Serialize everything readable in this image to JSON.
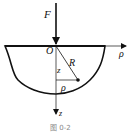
{
  "figure": {
    "caption": "图 0-2",
    "labels": {
      "force": "F",
      "origin": "O",
      "radial_axis": "ρ",
      "vertical_axis": "z",
      "radius": "R",
      "depth": "z",
      "radial_distance": "ρ"
    },
    "colors": {
      "stroke": "#111111",
      "background": "#ffffff",
      "caption": "#888888"
    }
  }
}
